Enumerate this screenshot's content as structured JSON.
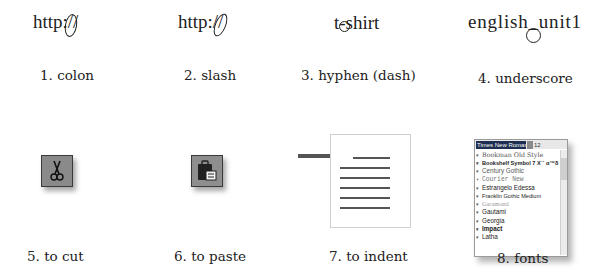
{
  "items": [
    {
      "number": "1.",
      "label": "1. colon",
      "example_text": "http://",
      "example_parts": [
        "http",
        ":",
        "//"
      ],
      "highlighted_char": ":"
    },
    {
      "number": "2.",
      "label": "2. slash",
      "example_text": "http://",
      "example_parts": [
        "http:",
        "//"
      ],
      "highlighted_char": "//"
    },
    {
      "number": "3.",
      "label": "3. hyphen (dash)",
      "example_text": "t-shirt",
      "example_parts": [
        "t",
        "-",
        "shirt"
      ],
      "highlighted_char": "-"
    },
    {
      "number": "4.",
      "label": "4. underscore",
      "example_text": "english_unit1",
      "example_parts": [
        "english",
        "_",
        "unit1"
      ],
      "highlighted_char": "_"
    },
    {
      "number": "5.",
      "label": "5. to cut",
      "icon": "scissors-icon"
    },
    {
      "number": "6.",
      "label": "6. to paste",
      "icon": "clipboard-paste-icon"
    },
    {
      "number": "7.",
      "label": "7. to indent",
      "icon": "indent-arrow-document"
    },
    {
      "number": "8.",
      "label": "8. fonts",
      "icon": "font-list-dropdown"
    }
  ],
  "font_dropdown": {
    "selected_font": "Times New Roman",
    "font_size": "12",
    "fonts": [
      "Bookman Old Style",
      "Bookshelf Symbol 7 Χ˙´ α™δ †",
      "Century Gothic",
      "Courier New",
      "Estrangelo Edessa",
      "Franklin Gothic Medium",
      "Garamond",
      "Gautami",
      "Georgia",
      "Impact",
      "Latha"
    ]
  },
  "colors": {
    "text": "#222222",
    "icon_bg": "#8a8a8a",
    "arrow": "#555555",
    "font_selected_bg": "#1e2e50"
  }
}
